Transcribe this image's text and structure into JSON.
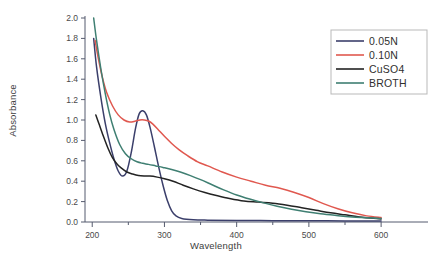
{
  "chart_data": {
    "type": "line",
    "title": "",
    "xlabel": "Wavelength",
    "ylabel": "Absorbance",
    "xlim": [
      190,
      640
    ],
    "ylim": [
      0.0,
      2.0
    ],
    "grid": false,
    "legend_position": "top-right",
    "xticks": [
      200,
      300,
      400,
      500,
      600
    ],
    "xtick_labels": [
      "200",
      "300",
      "400",
      "500",
      "600"
    ],
    "xminor_step": 50,
    "yticks": [
      0.0,
      0.2,
      0.4,
      0.6,
      0.8,
      1.0,
      1.2,
      1.4,
      1.6,
      1.8,
      2.0
    ],
    "ytick_labels": [
      "0.0",
      "0.2",
      "0.4",
      "0.6",
      "0.8",
      "1.0",
      "1.2",
      "1.4",
      "1.6",
      "1.8",
      "2.0"
    ],
    "series": [
      {
        "name": "0.05N",
        "color": "#3b3f6b",
        "x": [
          202,
          206,
          212,
          218,
          224,
          230,
          236,
          242,
          248,
          254,
          260,
          265,
          270,
          275,
          280,
          286,
          292,
          298,
          304,
          310,
          316,
          324,
          340,
          360,
          400,
          450,
          500,
          550,
          600
        ],
        "values": [
          1.8,
          1.52,
          1.22,
          0.97,
          0.78,
          0.62,
          0.5,
          0.45,
          0.5,
          0.68,
          0.92,
          1.06,
          1.09,
          1.05,
          0.93,
          0.74,
          0.54,
          0.36,
          0.21,
          0.11,
          0.06,
          0.035,
          0.022,
          0.018,
          0.015,
          0.013,
          0.012,
          0.011,
          0.01
        ]
      },
      {
        "name": "0.10N",
        "color": "#e0584f",
        "x": [
          204,
          208,
          214,
          220,
          228,
          236,
          244,
          252,
          260,
          266,
          272,
          278,
          284,
          292,
          300,
          310,
          320,
          332,
          346,
          360,
          380,
          400,
          420,
          440,
          460,
          480,
          500,
          520,
          540,
          560,
          580,
          600
        ],
        "values": [
          1.78,
          1.62,
          1.42,
          1.27,
          1.14,
          1.05,
          1.0,
          0.98,
          0.99,
          1.0,
          1.0,
          0.99,
          0.96,
          0.9,
          0.84,
          0.77,
          0.71,
          0.65,
          0.59,
          0.55,
          0.49,
          0.44,
          0.4,
          0.36,
          0.33,
          0.29,
          0.24,
          0.18,
          0.13,
          0.09,
          0.06,
          0.045
        ]
      },
      {
        "name": "CuSO4",
        "color": "#232323",
        "x": [
          205,
          210,
          216,
          222,
          228,
          234,
          240,
          248,
          256,
          264,
          272,
          280,
          290,
          300,
          312,
          326,
          340,
          356,
          372,
          390,
          410,
          430,
          450,
          470,
          490,
          510,
          530,
          550,
          570,
          600
        ],
        "values": [
          1.05,
          0.95,
          0.83,
          0.72,
          0.63,
          0.57,
          0.53,
          0.49,
          0.47,
          0.455,
          0.45,
          0.45,
          0.44,
          0.425,
          0.4,
          0.36,
          0.325,
          0.29,
          0.26,
          0.23,
          0.205,
          0.195,
          0.185,
          0.165,
          0.14,
          0.115,
          0.09,
          0.07,
          0.05,
          0.03
        ]
      },
      {
        "name": "BROTH",
        "color": "#3f7f72",
        "x": [
          202,
          206,
          212,
          218,
          224,
          230,
          238,
          246,
          254,
          262,
          270,
          278,
          288,
          298,
          310,
          322,
          336,
          350,
          366,
          382,
          400,
          418,
          436,
          456,
          476,
          496,
          516,
          536,
          560,
          600
        ],
        "values": [
          2.0,
          1.78,
          1.5,
          1.26,
          1.06,
          0.91,
          0.76,
          0.67,
          0.62,
          0.59,
          0.575,
          0.565,
          0.55,
          0.535,
          0.515,
          0.49,
          0.455,
          0.415,
          0.365,
          0.315,
          0.265,
          0.225,
          0.19,
          0.155,
          0.125,
          0.1,
          0.08,
          0.065,
          0.05,
          0.035
        ]
      }
    ]
  },
  "legend": {
    "entries": [
      {
        "label": "0.05N",
        "color": "#3b3f6b"
      },
      {
        "label": "0.10N",
        "color": "#e0584f"
      },
      {
        "label": "CuSO4",
        "color": "#232323"
      },
      {
        "label": "BROTH",
        "color": "#3f7f72"
      }
    ]
  },
  "axes": {
    "x_title": "Wavelength",
    "y_title": "Absorbance"
  }
}
